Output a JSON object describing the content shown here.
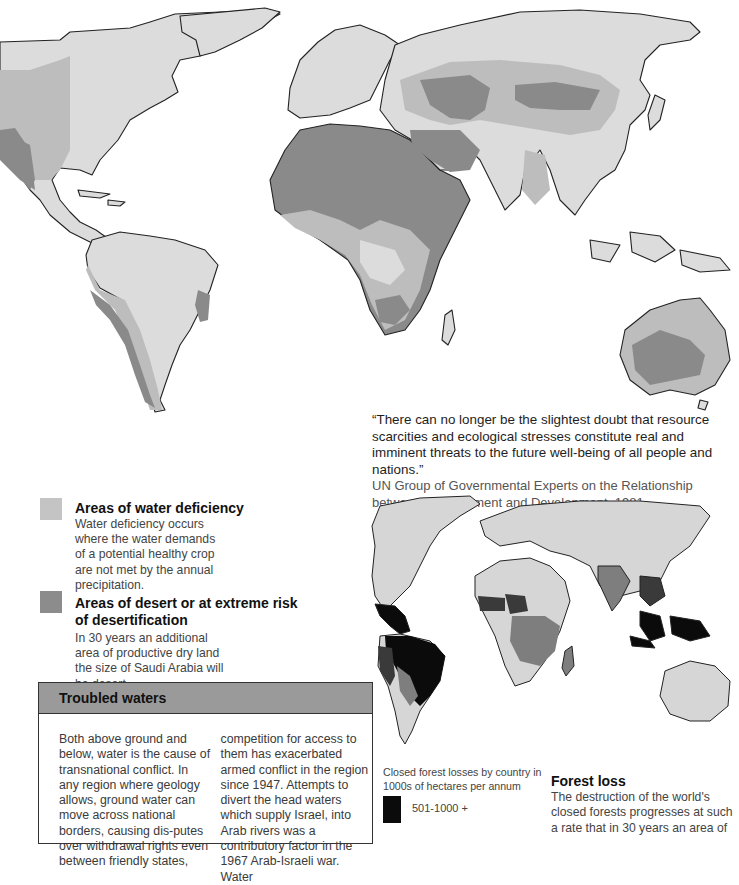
{
  "page": {
    "background": "#ffffff"
  },
  "top_map": {
    "name": "Water deficiency and desertification world map",
    "colors": {
      "land": "#dcdcdc",
      "water_deficiency": "#bdbdbd",
      "desert": "#8a8a8a",
      "outline": "#222222"
    }
  },
  "quote": {
    "text": "“There can no longer be the slightest doubt that resource scarcities and ecological stresses constitute real and imminent threats to the future well-being of all people and nations.”",
    "source": "UN Group of Governmental Experts on the Relationship between Disarmament and Development, 1981"
  },
  "legend": {
    "items": [
      {
        "title": "Areas of water deficiency",
        "text": "Water deficiency occurs where the water demands of a potential healthy crop are not met by the annual precipitation.",
        "color": "#c4c4c4"
      },
      {
        "title": "Areas of desert or at extreme risk of desertification",
        "text": "In 30 years an additional area of productive dry land the size of Saudi Arabia will be desert.",
        "color": "#8c8c8c"
      }
    ]
  },
  "troubled_waters": {
    "title": "Troubled waters",
    "col1": "Both above ground and below, water is the cause of transnational conflict. In any region where geology allows, ground water can move across national borders, causing dis-putes over withdrawal rights even between friendly states,",
    "col2": "competition for access to them has exacerbated armed conflict in the region since 1947. Attempts to divert the head waters which supply Israel, into Arab rivers was a contributory factor in the 1967 Arab-Israeli war. Water"
  },
  "bottom_map": {
    "name": "Closed forest losses world map",
    "colors": {
      "land": "#d6d6d6",
      "high": "#0b0b0b",
      "mid_high": "#3a3a3a",
      "mid": "#7e7e7e",
      "outline": "#222222"
    }
  },
  "forest_legend": {
    "caption": "Closed forest losses by country in 1000s of hectares per annum",
    "items": [
      {
        "range": "501-1000 +",
        "color": "#0b0b0b"
      }
    ]
  },
  "forest_loss": {
    "title": "Forest loss",
    "text": "The destruction of the world's closed forests progresses at such a rate that in 30 years an area of"
  }
}
